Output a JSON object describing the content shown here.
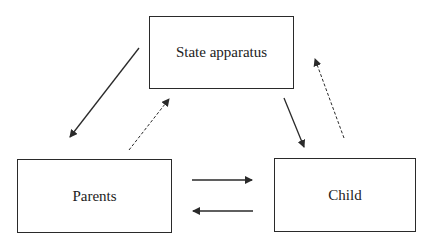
{
  "nodes": {
    "state": {
      "label": "State apparatus"
    },
    "parents": {
      "label": "Parents"
    },
    "child": {
      "label": "Child"
    }
  },
  "edges": [
    {
      "from": "State apparatus",
      "to": "Parents",
      "style": "solid"
    },
    {
      "from": "Parents",
      "to": "State apparatus",
      "style": "dashed"
    },
    {
      "from": "State apparatus",
      "to": "Child",
      "style": "solid"
    },
    {
      "from": "Child",
      "to": "State apparatus",
      "style": "dashed"
    },
    {
      "from": "Parents",
      "to": "Child",
      "style": "solid"
    },
    {
      "from": "Child",
      "to": "Parents",
      "style": "solid"
    }
  ],
  "colors": {
    "stroke": "#2a2a2a",
    "background": "#ffffff"
  }
}
